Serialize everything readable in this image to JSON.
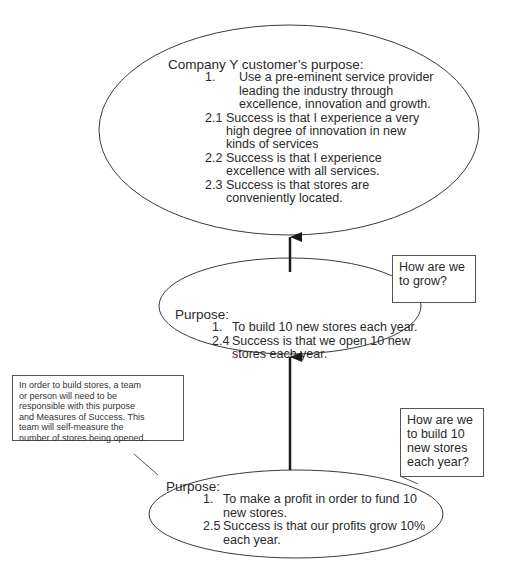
{
  "diagram": {
    "top_node": {
      "title": "Company Y customer’s purpose:",
      "items": [
        {
          "num": "1.",
          "lines": [
            "Use a pre-eminent service provider",
            "leading the industry through",
            "excellence, innovation and growth."
          ]
        },
        {
          "num": "2.1",
          "lines": [
            "Success is that I experience a very",
            "high degree of innovation in new",
            "kinds of services"
          ]
        },
        {
          "num": "2.2",
          "lines": [
            "Success is that I experience",
            "excellence with all services."
          ]
        },
        {
          "num": "2.3",
          "lines": [
            "Success is that stores are",
            "conveniently located."
          ]
        }
      ]
    },
    "middle_node": {
      "title": "Purpose:",
      "items": [
        {
          "num": "1.",
          "lines": [
            "To build 10 new stores each year."
          ]
        },
        {
          "num": "2.4",
          "lines": [
            "Success is that we open 10 new",
            "stores each year."
          ]
        }
      ]
    },
    "bottom_node": {
      "title": "Purpose:",
      "items": [
        {
          "num": "1.",
          "lines": [
            "To make a profit in order to fund 10",
            "new stores."
          ]
        },
        {
          "num": "2.5",
          "lines": [
            "Success is that our profits grow 10%",
            "each year."
          ]
        }
      ]
    },
    "callout_grow": {
      "lines": [
        "How are we",
        "to grow?"
      ]
    },
    "callout_build": {
      "lines": [
        "How are we",
        "to build 10",
        "new stores",
        "each year?"
      ]
    },
    "note_team": {
      "lines": [
        "In order to build stores, a team",
        "or person will need to be",
        "responsible with this purpose",
        "and Measures of Success. This",
        "team will self-measure the",
        "number of stores being opened."
      ]
    },
    "edges": [
      {
        "from": "middle_node",
        "to": "top_node",
        "type": "arrow"
      },
      {
        "from": "bottom_node",
        "to": "middle_node",
        "type": "arrow"
      }
    ],
    "colors": {
      "stroke": "#3a3a3a",
      "text": "#2a2a2a",
      "background": "#ffffff"
    }
  }
}
